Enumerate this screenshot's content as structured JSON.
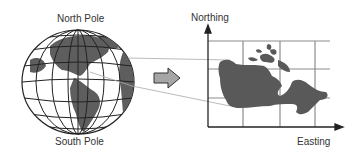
{
  "globe": {
    "north_label": "North Pole",
    "south_label": "South Pole"
  },
  "map": {
    "y_axis_label": "Northing",
    "x_axis_label": "Easting"
  },
  "colors": {
    "land": "#595959",
    "grid": "#888888",
    "lines": "#222222",
    "arrow_fill": "#a6a6a6"
  }
}
